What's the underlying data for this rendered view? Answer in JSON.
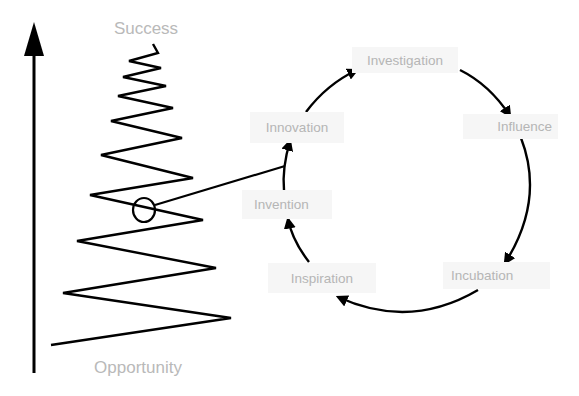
{
  "diagram": {
    "axis": {
      "top_label": "Success",
      "bottom_label": "Opportunity",
      "direction": "up"
    },
    "cycle": {
      "nodes": [
        {
          "id": "investigation",
          "label": "Investigation"
        },
        {
          "id": "influence",
          "label": "Influence"
        },
        {
          "id": "incubation",
          "label": "Incubation"
        },
        {
          "id": "inspiration",
          "label": "Inspiration"
        },
        {
          "id": "invention",
          "label": "Invention"
        },
        {
          "id": "innovation",
          "label": "Innovation"
        }
      ],
      "edges": [
        {
          "from": "investigation",
          "to": "influence"
        },
        {
          "from": "influence",
          "to": "incubation"
        },
        {
          "from": "incubation",
          "to": "inspiration"
        },
        {
          "from": "inspiration",
          "to": "invention"
        },
        {
          "from": "invention",
          "to": "innovation"
        },
        {
          "from": "innovation",
          "to": "investigation"
        }
      ]
    },
    "zigzag_callout": "circle on zigzag linked to Invention→Innovation edge",
    "colors": {
      "line": "#000000",
      "label_text": "#b5b5b5",
      "label_bg": "#f6f6f6",
      "axis_text": "#b9b9b9"
    }
  }
}
